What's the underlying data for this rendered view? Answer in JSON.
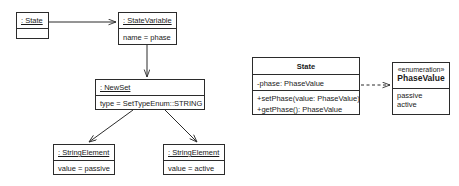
{
  "diagram": {
    "background_color": "#ffffff",
    "line_color": "#2b2b2b",
    "text_color": "#1a1a1a"
  },
  "object_diagram": {
    "state_object": {
      "header": ": State",
      "attributes": [],
      "empty_compartment": ""
    },
    "state_variable": {
      "header": ": StateVariable",
      "attributes": [
        "name = phase"
      ]
    },
    "new_set": {
      "header": ": NewSet",
      "attributes": [
        "type = SetTypeEnum::STRING"
      ]
    },
    "string_element_passive": {
      "header": ": StringElement",
      "attributes": [
        "value = passive"
      ]
    },
    "string_element_active": {
      "header": ": StringElement",
      "attributes": [
        "value = active"
      ]
    }
  },
  "class_diagram": {
    "state_class": {
      "name": "State",
      "attributes": [
        "-phase: PhaseValue"
      ],
      "operations": [
        "+setPhase(value: PhaseValue)",
        "+getPhase(): PhaseValue"
      ]
    },
    "phase_value_enum": {
      "stereotype": "«enumeration»",
      "name": "PhaseValue",
      "literals": [
        "passive",
        "active"
      ]
    }
  },
  "connectors": [
    {
      "name": "state-to-statevariable",
      "style": "solid",
      "arrow": "open"
    },
    {
      "name": "statevariable-to-newset",
      "style": "solid",
      "arrow": "open"
    },
    {
      "name": "newset-to-stringelement-passive",
      "style": "solid",
      "arrow": "open"
    },
    {
      "name": "newset-to-stringelement-active",
      "style": "solid",
      "arrow": "open"
    },
    {
      "name": "state-to-phasevalue-dependency",
      "style": "dashed",
      "arrow": "open"
    }
  ]
}
